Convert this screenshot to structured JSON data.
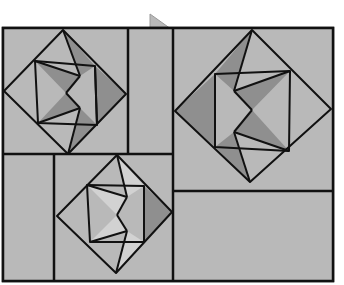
{
  "figure": {
    "colors": {
      "background": "#ffffff",
      "base": "#b9b9b9",
      "dark": "#8f8f8f",
      "light": "#d2d2d2",
      "line": "#111111"
    },
    "frame": {
      "x": 3,
      "y": 28,
      "w": 330,
      "h": 253
    },
    "tab": {
      "points": "150,14 150,29 171,29"
    },
    "panels": [
      {
        "name": "top-left-block",
        "x": 3,
        "y": 28,
        "w": 125,
        "h": 126
      },
      {
        "name": "top-middle-strip",
        "x": 128,
        "y": 28,
        "w": 45,
        "h": 126
      },
      {
        "name": "right-block",
        "x": 173,
        "y": 28,
        "w": 160,
        "h": 163
      },
      {
        "name": "bottom-left-strip",
        "x": 3,
        "y": 154,
        "w": 51,
        "h": 127
      },
      {
        "name": "bottom-middle-block",
        "x": 54,
        "y": 154,
        "w": 119,
        "h": 127
      },
      {
        "name": "bottom-right-panel",
        "x": 173,
        "y": 191,
        "w": 160,
        "h": 90
      }
    ],
    "blocks": [
      {
        "name": "top-left-star",
        "diamond": "63,30 126,94 68,154 4,91",
        "inner": "35,61 95,66 97,125 38,123",
        "dark": [
          "63,30 95,66 80,76",
          "35,61 66,93 80,76",
          "95,66 126,94 97,125",
          "38,123 66,93 80,108",
          "68,154 97,125 80,108"
        ],
        "light": [],
        "lines": [
          "63,30 80,76",
          "35,61 80,76",
          "80,76 66,93",
          "95,66 97,125",
          "38,123 80,108",
          "80,108 66,93",
          "68,154 80,108"
        ]
      },
      {
        "name": "right-star",
        "diamond": "252,30 331,109 250,182 175,111",
        "inner": "215,74 290,71 289,151 215,147",
        "dark": [
          "252,30 215,74 234,91",
          "175,111 215,74 215,147",
          "290,71 234,91 252,110",
          "289,151 234,132 252,110",
          "250,182 215,147 234,132"
        ],
        "light": [],
        "lines": [
          "252,30 234,91",
          "290,71 234,91",
          "234,91 252,110",
          "215,74 215,147",
          "289,151 234,132",
          "234,132 252,110",
          "250,182 234,132"
        ]
      },
      {
        "name": "bottom-middle-star",
        "diamond": "117,155 172,212 116,273 57,216",
        "inner": "87,185 144,186 144,242 90,242",
        "dark": [
          "144,186 172,212 144,242"
        ],
        "light": [
          "117,155 144,186 127,197",
          "87,185 127,197 117,215",
          "90,242 127,231 117,215",
          "116,273 144,242 127,231"
        ],
        "lines": [
          "117,155 127,197",
          "87,185 127,197",
          "127,197 117,215",
          "144,186 144,242",
          "90,242 127,231",
          "127,231 117,215",
          "116,273 127,231"
        ]
      }
    ],
    "divider_lines": [
      "128,28 128,154",
      "173,28 173,281",
      "3,154 173,154",
      "54,154 54,281",
      "173,191 333,191"
    ]
  }
}
